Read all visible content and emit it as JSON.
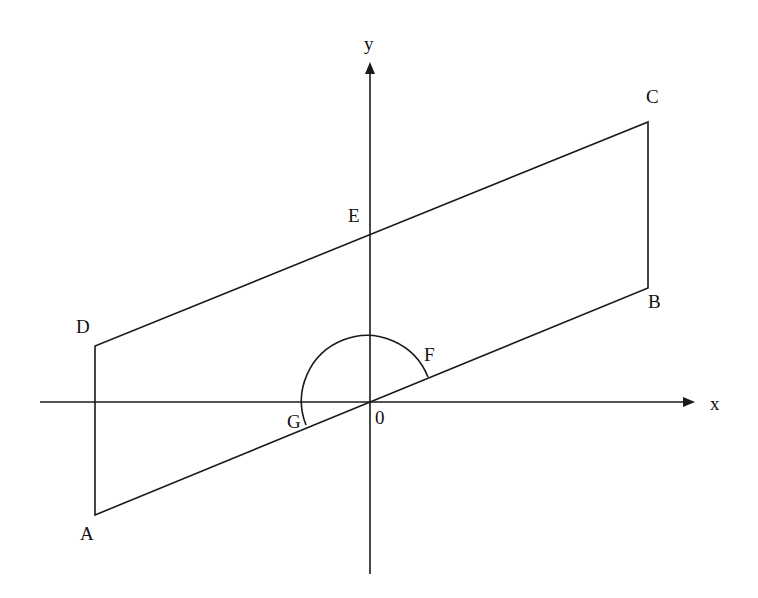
{
  "diagram": {
    "type": "geometry-parallelogram-on-axes",
    "axes": {
      "x_label": "x",
      "y_label": "y",
      "origin_label": "0"
    },
    "points": [
      {
        "id": "A",
        "label": "A",
        "x": 95,
        "y": 515,
        "lx": 80,
        "ly": 540
      },
      {
        "id": "B",
        "label": "B",
        "x": 648,
        "y": 288,
        "lx": 648,
        "ly": 308
      },
      {
        "id": "C",
        "label": "C",
        "x": 648,
        "y": 122,
        "lx": 646,
        "ly": 103
      },
      {
        "id": "D",
        "label": "D",
        "x": 95,
        "y": 346,
        "lx": 76,
        "ly": 333
      },
      {
        "id": "E",
        "label": "E",
        "x": 370,
        "y": 233,
        "lx": 348,
        "ly": 222
      },
      {
        "id": "F",
        "label": "F",
        "x": 428,
        "y": 377,
        "lx": 424,
        "ly": 361
      },
      {
        "id": "G",
        "label": "G",
        "x": 306,
        "y": 425,
        "lx": 287,
        "ly": 428
      }
    ],
    "edges": [
      [
        "A",
        "B"
      ],
      [
        "B",
        "C"
      ],
      [
        "C",
        "D"
      ],
      [
        "D",
        "A"
      ]
    ],
    "arc": {
      "center": [
        370,
        402
      ],
      "radius": 64,
      "from": "F",
      "to": "G"
    },
    "colors": {
      "stroke": "#1a1a1a",
      "background": "#ffffff"
    }
  }
}
